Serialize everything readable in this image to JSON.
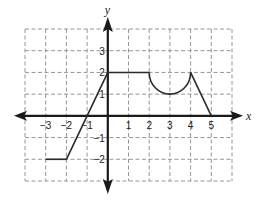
{
  "chart_data": {
    "type": "line",
    "title": "",
    "xlabel": "x",
    "ylabel": "y",
    "xlim": [
      -4,
      6
    ],
    "ylim": [
      -3,
      4
    ],
    "grid": true,
    "grid_style": "dashed",
    "x_ticks": [
      -3,
      -2,
      -1,
      1,
      2,
      3,
      4,
      5
    ],
    "x_tick_labels": [
      "−3",
      "−2",
      "−1",
      "1",
      "2",
      "3",
      "4",
      "5"
    ],
    "y_ticks": [
      -2,
      -1,
      1,
      2,
      3
    ],
    "y_tick_labels": [
      "−2",
      "−1",
      "1",
      "2",
      "3"
    ],
    "series": [
      {
        "name": "f",
        "segments": [
          {
            "kind": "line",
            "points": [
              [
                -3,
                -2
              ],
              [
                -2,
                -2
              ]
            ]
          },
          {
            "kind": "line",
            "points": [
              [
                -2,
                -2
              ],
              [
                0,
                2
              ]
            ]
          },
          {
            "kind": "line",
            "points": [
              [
                0,
                2
              ],
              [
                2,
                2
              ]
            ]
          },
          {
            "kind": "semicircle-lower",
            "center": [
              3,
              2
            ],
            "radius": 1,
            "from": [
              2,
              2
            ],
            "to": [
              4,
              2
            ]
          },
          {
            "kind": "line",
            "points": [
              [
                4,
                2
              ],
              [
                5,
                0
              ]
            ]
          }
        ]
      }
    ],
    "colors": {
      "curve": "#2a2a2a",
      "axis": "#1a1a1a",
      "grid": "#8a8a8a"
    }
  }
}
